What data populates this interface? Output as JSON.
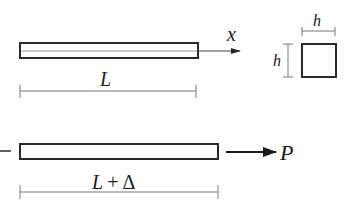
{
  "diagram": {
    "top_bar": {
      "axis_label": "x",
      "length_label": "L"
    },
    "cross_section": {
      "width_label": "h",
      "height_label": "h"
    },
    "bottom_bar": {
      "force_label": "P",
      "length_label_main": "L",
      "length_label_op": "+",
      "length_label_delta": "Δ"
    },
    "colors": {
      "stroke": "#2a2a2a",
      "dim_line": "#777777",
      "background": "#ffffff"
    }
  }
}
